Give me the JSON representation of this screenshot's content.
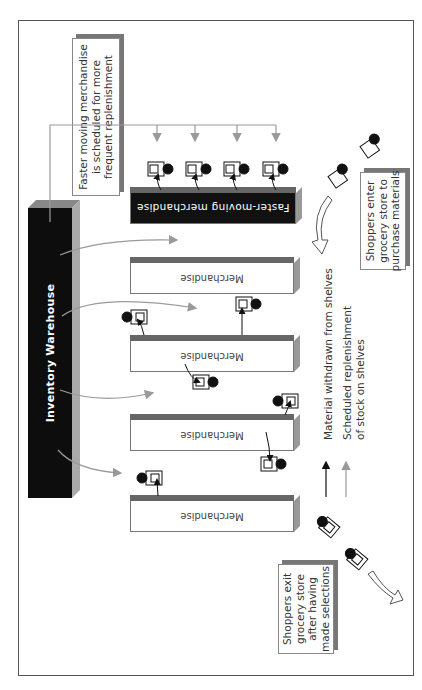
{
  "callouts": {
    "replenishment": "Faster moving merchandise\nis scheduled for more\nfrequent replenishment",
    "enter": "Shoppers enter\ngrocery store to\npurchase materials",
    "exit": "Shoppers exit\ngrocery store\nafter having\nmade selections"
  },
  "warehouse": {
    "label": "Inventory Warehouse"
  },
  "shelves": {
    "fast": "Faster-moving merchandise",
    "items": [
      "Merchandise",
      "Merchandise",
      "Merchandise",
      "Merchandise"
    ]
  },
  "legend": {
    "withdrawn": "Material withdrawn from shelves",
    "replenish": "Scheduled replenishment\nof stock on shelves"
  },
  "colors": {
    "withdraw_arrow": "#111111",
    "replenish_arrow": "#9a9a9a",
    "shelf_dark": "#111111",
    "shelf_top": "#666666"
  }
}
